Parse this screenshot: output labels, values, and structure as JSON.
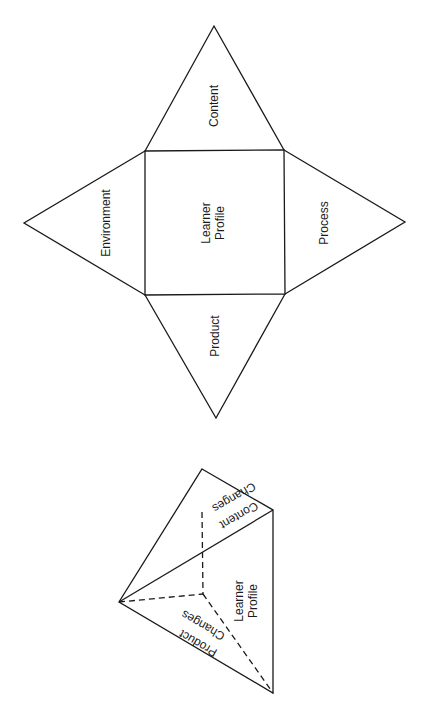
{
  "net": {
    "center_label_line1": "Learner",
    "center_label_line2": "Profile",
    "faces": {
      "top": "Content",
      "left": "Environment",
      "right": "Process",
      "bottom": "Product"
    }
  },
  "pyramid": {
    "content_line1": "Content",
    "content_line2": "Changes",
    "product_line1": "Product",
    "product_line2": "Changes",
    "base_line1": "Learner",
    "base_line2": "Profile"
  },
  "colors": {
    "stroke": "#1a1a1a",
    "background": "#ffffff"
  }
}
